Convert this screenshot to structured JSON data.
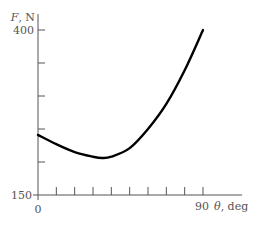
{
  "chart_data": {
    "type": "line",
    "title": "",
    "xlabel": "θ, deg",
    "ylabel": "F, N",
    "xlim": [
      0,
      90
    ],
    "ylim": [
      150,
      400
    ],
    "x_tick_labels": [
      "0",
      "90"
    ],
    "y_tick_labels": [
      "150",
      "400"
    ],
    "x_ticks": [
      0,
      10,
      20,
      30,
      40,
      50,
      60,
      70,
      80,
      90
    ],
    "y_ticks": [
      150,
      200,
      250,
      300,
      350,
      400
    ],
    "grid": false,
    "legend": null,
    "series": [
      {
        "name": "F",
        "x": [
          0,
          10,
          20,
          30,
          35,
          40,
          50,
          60,
          70,
          80,
          90
        ],
        "values": [
          241,
          227,
          215,
          208,
          206,
          208,
          221,
          250,
          288,
          339,
          400
        ]
      }
    ]
  },
  "axes": {
    "y_label_var": "F",
    "y_label_unit": ", N",
    "x_label_var": "θ",
    "x_label_unit": ", deg",
    "y_top_label": "400",
    "y_bottom_label": "150",
    "x_left_label": "0",
    "x_right_label": "90"
  },
  "colors": {
    "axis": "#555555",
    "curve": "#000000",
    "text": "#555555"
  }
}
